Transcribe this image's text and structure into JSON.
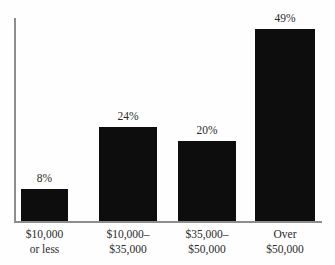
{
  "chart_data": {
    "type": "bar",
    "title": "",
    "subtitle": "",
    "xlabel": "",
    "ylabel": "",
    "categories": [
      "$10,000 or less",
      "$10,000–$35,000",
      "$35,000–$50,000",
      "Over $50,000"
    ],
    "category_lines": [
      [
        "$10,000",
        "or less"
      ],
      [
        "$10,000–",
        "$35,000"
      ],
      [
        "$35,000–",
        "$50,000"
      ],
      [
        "Over",
        "$50,000"
      ]
    ],
    "values": [
      8,
      24,
      20,
      49
    ],
    "value_labels": [
      "8%",
      "24%",
      "20%",
      "49%"
    ],
    "ylim": [
      0,
      51
    ],
    "grid": false,
    "legend": false,
    "legend_position": "none",
    "bar_color": "#0d0d0d",
    "axis_color": "#8d8d8d",
    "background_color": "#fefefe",
    "text_color": "#2a2a2a"
  },
  "layout": {
    "bars": [
      {
        "left": 21,
        "width": 47,
        "top": 190
      },
      {
        "left": 99,
        "width": 58,
        "top": 128
      },
      {
        "left": 178,
        "width": 58,
        "top": 142
      },
      {
        "left": 255,
        "width": 60,
        "top": 30
      }
    ],
    "baseline_y": 222,
    "axis_top_y": 18,
    "axis_left_x": 14,
    "axis_right_x": 322
  }
}
